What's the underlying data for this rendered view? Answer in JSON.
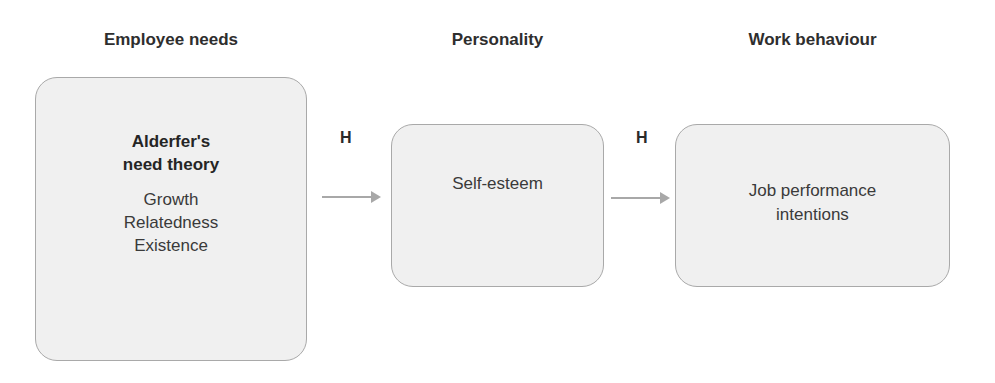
{
  "columns": [
    {
      "heading": "Employee needs",
      "box": {
        "title_lines": [
          "Alderfer's",
          "need theory"
        ],
        "items": [
          "Growth",
          "Relatedness",
          "Existence"
        ]
      }
    },
    {
      "heading": "Personality",
      "box": {
        "text_lines": [
          "Self-esteem"
        ]
      }
    },
    {
      "heading": "Work behaviour",
      "box": {
        "text_lines": [
          "Job performance",
          "intentions"
        ]
      }
    }
  ],
  "connectors": [
    {
      "label": "H",
      "from": "Employee needs",
      "to": "Personality"
    },
    {
      "label": "H",
      "from": "Personality",
      "to": "Work behaviour"
    }
  ],
  "colors": {
    "box_fill": "#f0f0f0",
    "box_border": "#a9a9a9",
    "arrow": "#a8a8a8",
    "text": "#2b2b2b"
  }
}
